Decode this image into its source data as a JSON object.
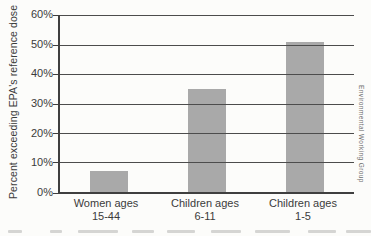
{
  "chart_data": {
    "type": "bar",
    "title": "",
    "ylabel": "Percent exceeding EPA's reference dose",
    "categories": [
      {
        "line1": "Women ages",
        "line2": "15-44"
      },
      {
        "line1": "Children ages",
        "line2": "6-11"
      },
      {
        "line1": "Children ages",
        "line2": "1-5"
      }
    ],
    "values": [
      7,
      35,
      51
    ],
    "unit": "%",
    "ylim": [
      0,
      60
    ],
    "ytick_labels": [
      "60%",
      "50%",
      "40%",
      "30%",
      "20%",
      "10%",
      "0%"
    ],
    "grid": true,
    "legend_position": "none",
    "bar_color": "#a9a9a9",
    "gridline_color": "#4c4c4c",
    "axis_color": "#3f3f3f",
    "text_color": "#3b3b3b"
  },
  "credit": "Environmental Working Group"
}
